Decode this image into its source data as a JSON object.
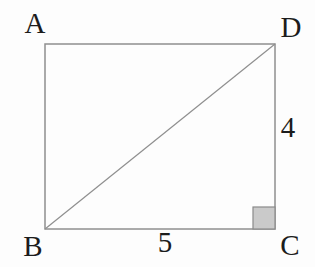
{
  "figure": {
    "type": "geometry-diagram",
    "shape": "rectangle-with-diagonal",
    "vertices": [
      {
        "label": "A",
        "position": "top-left"
      },
      {
        "label": "B",
        "position": "bottom-left"
      },
      {
        "label": "C",
        "position": "bottom-right"
      },
      {
        "label": "D",
        "position": "top-right"
      }
    ],
    "side_labels": [
      {
        "side": "BC",
        "value": "5",
        "placement": "below-bottom-side"
      },
      {
        "side": "CD",
        "value": "4",
        "placement": "right-of-right-side"
      }
    ],
    "diagonal": "BD",
    "right_angle_marker_at": "C",
    "colors": {
      "line": "#8f8f8f",
      "right_angle_fill": "#cacaca",
      "right_angle_stroke": "#8a8a8a",
      "text": "#1c1c1c",
      "background": "#fdfdfd"
    }
  }
}
